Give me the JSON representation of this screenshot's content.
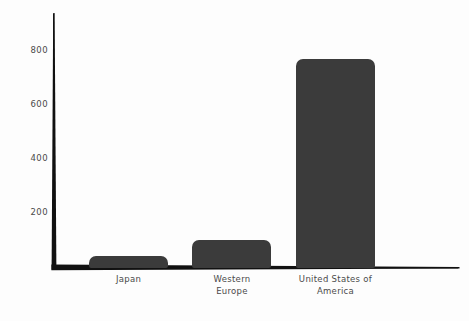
{
  "chart_data": {
    "type": "bar",
    "title": "",
    "subtitle": "",
    "xlabel": "",
    "ylabel": "",
    "categories": [
      "Japan",
      "Western Europe",
      "United States of America"
    ],
    "values": [
      45,
      103,
      777
    ],
    "series": [
      {
        "name": "",
        "values": [
          45,
          103,
          777
        ]
      }
    ],
    "ylim": [
      0,
      900
    ],
    "yticks": [
      200,
      400,
      600,
      800
    ],
    "ytick_labels": [
      "200",
      "400",
      "600",
      "800"
    ],
    "xtick_labels": [
      "Japan",
      "Western\nEurope",
      "United States of\nAmerica"
    ],
    "grid": false,
    "legend": false,
    "legend_position": "none",
    "style": "hand-drawn",
    "bar_color": "#3b3b3b",
    "axis_color": "#111111",
    "background_color": "#fdfdfd",
    "tick_label_color": "#4a4a4a"
  },
  "geometry": {
    "axis_origin_x": 53,
    "axis_origin_y": 268,
    "axis_top_y": 13,
    "axis_right_x": 460,
    "pixels_per_unit": 0.2695,
    "bar_width_px": 79,
    "bar_left_px": [
      89,
      192,
      296
    ],
    "xtick_center_px": [
      128.5,
      232,
      335.5
    ],
    "ytick_y_px": [
      212,
      158,
      104,
      50
    ]
  }
}
